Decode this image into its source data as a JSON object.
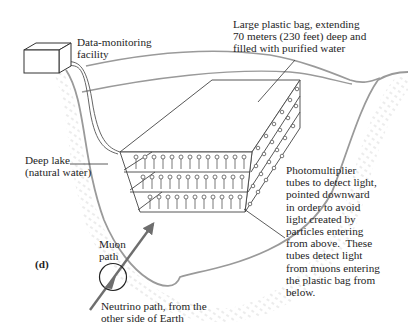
{
  "figure": {
    "panel_label": "(d)",
    "labels": {
      "facility": "Data-monitoring\nfacility",
      "bag": "Large plastic bag, extending\n70 meters (230 feet) deep and\nfilled with purified water",
      "lake": "Deep lake\n(natural water)",
      "tubes": "Photomultiplier\ntubes to detect light,\npointed downward\nin order to avoid\nlight created by\nparticles entering\nfrom above.  These\ntubes detect light\nfrom muons entering\nthe plastic bag from\nbelow.",
      "muon": "Muon\npath",
      "neutrino": "Neutrino path, from the\nother side of Earth"
    },
    "colors": {
      "ground_line": "#9a9a9a",
      "ink": "#2a2a2a",
      "stipple": "#c8c8c8",
      "arrow": "#6e6e6e"
    }
  }
}
